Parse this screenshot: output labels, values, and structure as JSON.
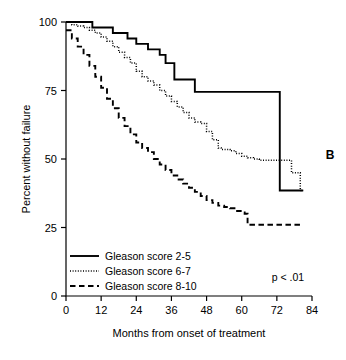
{
  "panel": {
    "label": "B"
  },
  "chart_data": {
    "type": "line",
    "title": "",
    "subtitle": "",
    "xlabel": "Months from onset of treatment",
    "ylabel": "Percent without failure",
    "xlim": [
      0,
      84
    ],
    "ylim": [
      0,
      100
    ],
    "xticks": [
      0,
      12,
      24,
      36,
      48,
      60,
      72,
      84
    ],
    "xtick_labels": [
      "0",
      "12",
      "24",
      "36",
      "48",
      "60",
      "72",
      "84"
    ],
    "yticks": [
      0,
      25,
      50,
      75,
      100
    ],
    "ytick_labels": [
      "0",
      "25",
      "50",
      "75",
      "100"
    ],
    "grid": false,
    "legend_position": "lower-left",
    "annotations": [
      {
        "name": "p-value",
        "text": "p < .01",
        "x": 63,
        "y": 10
      },
      {
        "name": "panel-letter",
        "text": "B",
        "x": 88,
        "y": 48
      }
    ],
    "series": [
      {
        "name": "Gleason score 2-5",
        "style": "solid",
        "color": "#000000",
        "step": "post",
        "x": [
          0,
          3,
          8,
          9,
          15,
          16,
          20,
          21,
          23,
          24,
          27,
          28,
          31,
          32,
          33,
          34,
          36,
          37,
          43,
          44,
          72,
          73,
          81
        ],
        "y": [
          100,
          100,
          100,
          98,
          98,
          96,
          96,
          94,
          94,
          92,
          92,
          90,
          90,
          88,
          88,
          85,
          85,
          79,
          79,
          74.5,
          74.5,
          38.5,
          38.5
        ]
      },
      {
        "name": "Gleason score 6-7",
        "style": "dotted",
        "color": "#000000",
        "step": "post",
        "x": [
          0,
          2,
          4,
          6,
          8,
          10,
          12,
          14,
          16,
          18,
          20,
          22,
          24,
          26,
          28,
          30,
          32,
          34,
          36,
          38,
          40,
          42,
          44,
          46,
          48,
          50,
          52,
          53,
          56,
          58,
          60,
          62,
          64,
          66,
          68,
          70,
          72,
          74,
          76,
          77,
          78,
          79,
          80,
          81
        ],
        "y": [
          100,
          99,
          98.5,
          98,
          97,
          96,
          94.5,
          93,
          91,
          89,
          87,
          85,
          82,
          80,
          78.5,
          77,
          75,
          73,
          71,
          69,
          67,
          65,
          63.5,
          63,
          60,
          57,
          54,
          53.5,
          53,
          52,
          51,
          50.5,
          50,
          49.5,
          49.5,
          49.5,
          49.5,
          49.5,
          49.5,
          45,
          45,
          45,
          38.5,
          38.5
        ]
      },
      {
        "name": "Gleason score 8-10",
        "style": "dashed",
        "color": "#000000",
        "step": "post",
        "x": [
          0,
          2,
          4,
          6,
          8,
          10,
          12,
          14,
          16,
          18,
          20,
          22,
          24,
          26,
          28,
          30,
          32,
          34,
          36,
          38,
          40,
          42,
          44,
          46,
          48,
          50,
          52,
          54,
          56,
          58,
          60,
          61,
          62,
          64,
          68,
          72,
          76,
          80,
          81
        ],
        "y": [
          97,
          94,
          91,
          88,
          84,
          80,
          76,
          72,
          68.5,
          65,
          62,
          59,
          56,
          54,
          52.5,
          50,
          48,
          46,
          44,
          42.5,
          41,
          39.5,
          38,
          36.5,
          35,
          34,
          33,
          32.5,
          32,
          31,
          30.5,
          30,
          26,
          26,
          26,
          26,
          26,
          26,
          26
        ]
      }
    ],
    "legend": [
      {
        "label": "Gleason score 2-5",
        "style": "solid"
      },
      {
        "label": "Gleason score 6-7",
        "style": "dotted"
      },
      {
        "label": "Gleason score 8-10",
        "style": "dashed"
      }
    ]
  }
}
